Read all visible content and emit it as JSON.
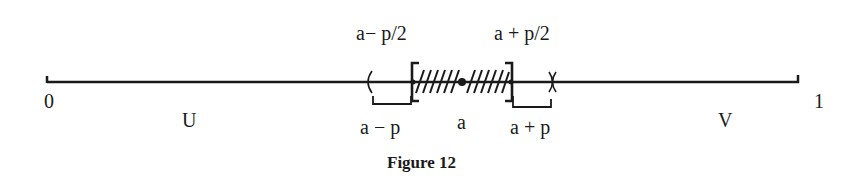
{
  "figure": {
    "caption": "Figure 12",
    "endpoints": {
      "left": "0",
      "right": "1"
    },
    "regions": {
      "left": "U",
      "right": "V"
    },
    "top_labels": {
      "left_half": "a− p/2",
      "right_half": "a + p/2"
    },
    "bottom_labels": {
      "left_full": "a − p",
      "center": "a",
      "right_full": "a + p"
    },
    "colors": {
      "ink": "#1a1a1a",
      "background": "#ffffff"
    }
  }
}
